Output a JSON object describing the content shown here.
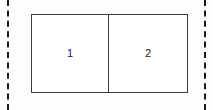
{
  "canvas": {
    "width": 213,
    "height": 110,
    "background_color": "#fefefe"
  },
  "guides": {
    "name": "page-margin-guides",
    "style": "dashed",
    "color": "#1a1a1a",
    "items": [
      {
        "id": "left-guide",
        "orientation": "vertical"
      },
      {
        "id": "right-guide",
        "orientation": "vertical"
      }
    ]
  },
  "figure": {
    "name": "two-cell-table",
    "border_color": "#3c3c3c",
    "fill_color": "#ffffff",
    "cells": [
      {
        "label": "1"
      },
      {
        "label": "2"
      }
    ]
  }
}
